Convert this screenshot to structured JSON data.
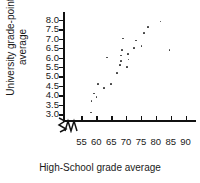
{
  "chart_data": {
    "type": "scatter",
    "title": "",
    "xlabel": "High-School grade average",
    "ylabel_line1": "University grade-point",
    "ylabel_line2": "average",
    "xlim": [
      52.5,
      92.5
    ],
    "ylim": [
      2.75,
      8.25
    ],
    "xticks": [
      55,
      60,
      65,
      70,
      75,
      80,
      85,
      90
    ],
    "xticklabels": [
      "55",
      "60",
      "65",
      "70",
      "75",
      "80",
      "85",
      "90"
    ],
    "yticks": [
      3.0,
      3.5,
      4.0,
      4.5,
      5.0,
      5.5,
      6.0,
      6.5,
      7.0,
      7.5,
      8.0
    ],
    "yticklabels": [
      "3.0",
      "3.5",
      "4.0",
      "4.5",
      "5.0",
      "5.5",
      "6.0",
      "6.5",
      "7.0",
      "7.5",
      "8.0"
    ],
    "grid": false,
    "legend": false,
    "axis_break_x": true,
    "axis_break_y": true,
    "marker_color": "#3a3a3a",
    "axis_color": "#111111",
    "points": [
      {
        "x": 58.2,
        "y": 3.1
      },
      {
        "x": 58.4,
        "y": 3.7
      },
      {
        "x": 59.3,
        "y": 4.1
      },
      {
        "x": 60.1,
        "y": 3.9
      },
      {
        "x": 60.6,
        "y": 4.6
      },
      {
        "x": 62.6,
        "y": 4.4
      },
      {
        "x": 65.0,
        "y": 4.6
      },
      {
        "x": 63.6,
        "y": 6.0
      },
      {
        "x": 67.0,
        "y": 5.2
      },
      {
        "x": 68.0,
        "y": 5.6
      },
      {
        "x": 68.2,
        "y": 5.8
      },
      {
        "x": 68.4,
        "y": 6.1
      },
      {
        "x": 68.6,
        "y": 6.4
      },
      {
        "x": 69.0,
        "y": 7.0
      },
      {
        "x": 70.4,
        "y": 5.5
      },
      {
        "x": 70.6,
        "y": 6.2
      },
      {
        "x": 70.8,
        "y": 5.9
      },
      {
        "x": 72.6,
        "y": 6.5
      },
      {
        "x": 73.4,
        "y": 6.9
      },
      {
        "x": 75.2,
        "y": 6.6
      },
      {
        "x": 76.0,
        "y": 7.3
      },
      {
        "x": 77.4,
        "y": 7.6
      },
      {
        "x": 81.6,
        "y": 7.9
      },
      {
        "x": 84.6,
        "y": 6.4
      }
    ]
  }
}
